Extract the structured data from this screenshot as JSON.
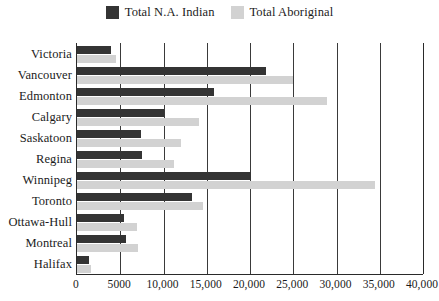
{
  "legend": {
    "position": "top-center",
    "entries": [
      {
        "label": "Total N.A. Indian",
        "color": "#343434",
        "swatch_name": "legend-swatch-na-indian"
      },
      {
        "label": "Total Aboriginal",
        "color": "#d2d2d2",
        "swatch_name": "legend-swatch-aboriginal"
      }
    ]
  },
  "axis": {
    "x": {
      "min": 0,
      "max": 40000,
      "tick_step": 5000,
      "tick_labels": [
        "0",
        "5000",
        "10,000",
        "15,000",
        "20,000",
        "25,000",
        "30,000",
        "35,000",
        "40,000"
      ],
      "tick_values": [
        0,
        5000,
        10000,
        15000,
        20000,
        25000,
        30000,
        35000,
        40000
      ],
      "label": ""
    },
    "y": {
      "label": "",
      "categories": [
        "Victoria",
        "Vancouver",
        "Edmonton",
        "Calgary",
        "Saskatoon",
        "Regina",
        "Winnipeg",
        "Toronto",
        "Ottawa-Hull",
        "Montreal",
        "Halifax"
      ]
    }
  },
  "chart_data": {
    "type": "bar",
    "orientation": "horizontal",
    "title": "",
    "subtitle": "",
    "xlabel": "",
    "ylabel": "",
    "xlim": [
      0,
      40000
    ],
    "grid": true,
    "legend_position": "top-center",
    "categories": [
      "Victoria",
      "Vancouver",
      "Edmonton",
      "Calgary",
      "Saskatoon",
      "Regina",
      "Winnipeg",
      "Toronto",
      "Ottawa-Hull",
      "Montreal",
      "Halifax"
    ],
    "series": [
      {
        "name": "Total N.A. Indian",
        "color": "#343434",
        "values": [
          3900,
          21900,
          15800,
          10000,
          7400,
          7500,
          20100,
          13300,
          5400,
          5700,
          1400
        ]
      },
      {
        "name": "Total Aboriginal",
        "color": "#d2d2d2",
        "values": [
          4500,
          25000,
          28900,
          14100,
          12000,
          11200,
          34500,
          14600,
          6900,
          7000,
          1600
        ]
      }
    ]
  }
}
